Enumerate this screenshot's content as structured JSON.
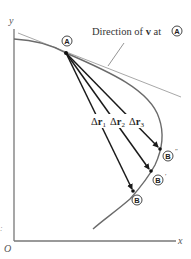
{
  "figure": {
    "axes": {
      "x_label": "x",
      "y_label": "y",
      "origin_label": "O"
    },
    "tangent_annotation": {
      "text_prefix": "Direction of ",
      "vector": "v",
      "text_middle": " at ",
      "point_ref": "A"
    },
    "points": {
      "A": {
        "label": "A",
        "prime": ""
      },
      "B": {
        "label": "B",
        "prime": ""
      },
      "B_prime": {
        "label": "B",
        "prime": "′"
      },
      "B_double_prime": {
        "label": "B",
        "prime": "″"
      }
    },
    "displacements": [
      {
        "symbol": "Δ",
        "vector": "r",
        "subscript": "1"
      },
      {
        "symbol": "Δ",
        "vector": "r",
        "subscript": "2"
      },
      {
        "symbol": "Δ",
        "vector": "r",
        "subscript": "3"
      }
    ],
    "side_mark": ":",
    "colors": {
      "curve": "#6b6b6b",
      "tangent": "#a8a8a8",
      "arrows": "#1a1a1a",
      "axes": "#777777"
    }
  }
}
